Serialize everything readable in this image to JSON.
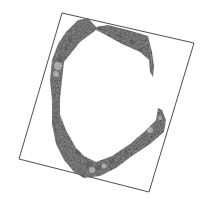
{
  "image": {
    "description": "Grayscale textured C-shaped specimen inside a rotated rectangular frame",
    "background_color": "#ffffff",
    "frame": {
      "stroke_color": "#3a3a3a",
      "corners": [
        [
          62,
          13
        ],
        [
          194,
          43
        ],
        [
          149,
          192
        ],
        [
          19,
          159
        ]
      ]
    },
    "specimen": {
      "shape": "C",
      "base_color": "#9a9a9a",
      "dark_color": "#5a5a5a",
      "light_color": "#c8c8c8"
    }
  }
}
